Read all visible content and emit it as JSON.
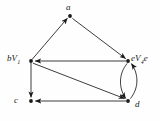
{
  "figure": {
    "type": "directed-graph-diagram",
    "background_color": "#fefefe",
    "stroke_color": "#1a1a1a"
  },
  "nodes": [
    {
      "id": "a",
      "label_main": "a",
      "label_sub": "",
      "label_tail": "",
      "x": 70,
      "y": 16
    },
    {
      "id": "b",
      "label_main": "bV",
      "label_sub": "1",
      "label_tail": "",
      "x": 31,
      "y": 61
    },
    {
      "id": "e",
      "label_main": "eV",
      "label_sub": "4",
      "label_tail": "e",
      "x": 128,
      "y": 61
    },
    {
      "id": "c",
      "label_main": "c",
      "label_sub": "",
      "label_tail": "",
      "x": 31,
      "y": 101
    },
    {
      "id": "d",
      "label_main": "d",
      "label_sub": "",
      "label_tail": "",
      "x": 128,
      "y": 101
    }
  ],
  "edges": [
    {
      "id": "b-to-a",
      "from": "b",
      "to": "a",
      "shape": "straight",
      "arrow": "head-at-target"
    },
    {
      "id": "a-to-e",
      "from": "a",
      "to": "e",
      "shape": "straight",
      "arrow": "head-at-target"
    },
    {
      "id": "e-to-b",
      "from": "e",
      "to": "b",
      "shape": "straight",
      "arrow": "head-at-target"
    },
    {
      "id": "b-to-c",
      "from": "b",
      "to": "c",
      "shape": "straight",
      "arrow": "head-at-target"
    },
    {
      "id": "b-to-d",
      "from": "b",
      "to": "d",
      "shape": "straight",
      "arrow": "head-at-target"
    },
    {
      "id": "d-to-c",
      "from": "d",
      "to": "c",
      "shape": "straight",
      "arrow": "head-at-target"
    },
    {
      "id": "e-to-d",
      "from": "e",
      "to": "d",
      "shape": "curve-left",
      "arrow": "head-at-target"
    },
    {
      "id": "d-to-e",
      "from": "d",
      "to": "e",
      "shape": "curve-right",
      "arrow": "head-at-target"
    }
  ]
}
